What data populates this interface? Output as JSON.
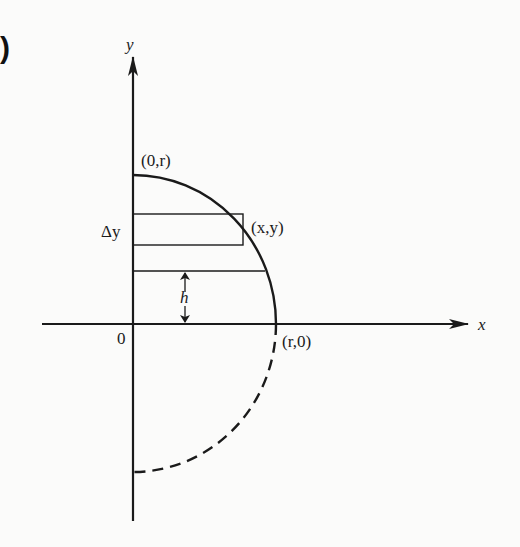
{
  "figure": {
    "corner_mark": ")",
    "axes": {
      "x_label": "x",
      "y_label": "y",
      "origin_label": "0"
    },
    "points": {
      "top": "(0,r)",
      "right": "(r,0)",
      "strip_corner": "(x,y)"
    },
    "annotations": {
      "strip_height": "Δy",
      "height": "h"
    },
    "colors": {
      "ink": "#1a1a1a",
      "background": "#fbfbfa"
    }
  }
}
